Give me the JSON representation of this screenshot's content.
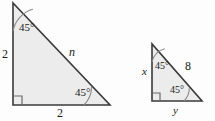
{
  "figure": {
    "background_color": "#fdfdfd",
    "fill_color": "#ececec",
    "stroke_color": "#3a3a3a",
    "label_color": "#1a1a1a",
    "triangles": [
      {
        "name": "left-triangle",
        "vertices": {
          "apex": [
            13,
            3
          ],
          "bottom_left": [
            13,
            105
          ],
          "bottom_right": [
            110,
            105
          ]
        },
        "right_angle_at": "bottom_left",
        "labels": {
          "top_angle": "45°",
          "bottom_right_angle": "45°",
          "vertical_leg": "2",
          "horizontal_leg": "2",
          "hypotenuse": "n"
        }
      },
      {
        "name": "right-triangle",
        "vertices": {
          "apex": [
            152,
            44
          ],
          "bottom_left": [
            152,
            101
          ],
          "bottom_right": [
            202,
            101
          ]
        },
        "right_angle_at": "bottom_left",
        "labels": {
          "top_angle": "45°",
          "bottom_right_angle": "45°",
          "vertical_leg": "x",
          "horizontal_leg": "y",
          "hypotenuse": "8"
        }
      }
    ]
  }
}
